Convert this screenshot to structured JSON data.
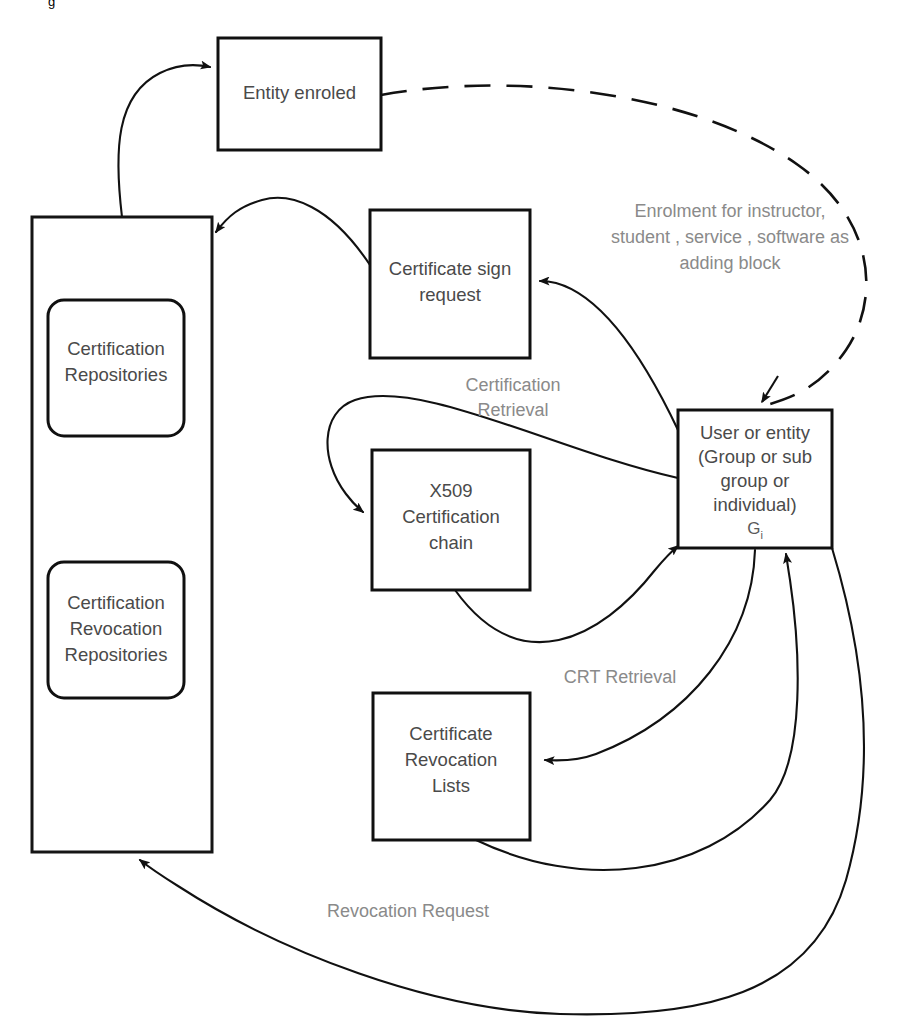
{
  "diagram": {
    "background_color": "#ffffff",
    "stroke_color": "#111111",
    "label_color": "#4a4a4a",
    "edge_label_color": "#8a8a8a",
    "corner_artifact": "g"
  },
  "nodes": {
    "entity_enroled": {
      "label": "Entity enroled",
      "shape": "rectangle"
    },
    "repositories_container": {
      "label": "",
      "shape": "rectangle"
    },
    "certification_repositories": {
      "line1": "Certification",
      "line2": "Repositories",
      "shape": "rounded-rectangle"
    },
    "certification_revocation_repositories": {
      "line1": "Certification",
      "line2": "Revocation",
      "line3": "Repositories",
      "shape": "rounded-rectangle"
    },
    "certificate_sign_request": {
      "line1": "Certificate sign",
      "line2": "request",
      "shape": "rectangle"
    },
    "x509_certification_chain": {
      "line1": "X509",
      "line2": "Certification",
      "line3": "chain",
      "shape": "rectangle"
    },
    "certificate_revocation_lists": {
      "line1": "Certificate",
      "line2": "Revocation",
      "line3": "Lists",
      "shape": "rectangle"
    },
    "user_or_entity": {
      "line1": "User or entity",
      "line2": "(Group or sub",
      "line3": "group or",
      "line4": "individual)",
      "line5_base": "G",
      "line5_sub": "i",
      "shape": "rectangle"
    }
  },
  "edge_labels": {
    "enrolment": {
      "line1": "Enrolment for instructor,",
      "line2": "student , service , software as",
      "line3": "adding block"
    },
    "certification_retrieval": {
      "line1": "Certification",
      "line2": "Retrieval"
    },
    "crt_retrieval": {
      "line1": "CRT Retrieval"
    },
    "revocation_request": {
      "line1": "Revocation Request"
    }
  },
  "edges": [
    {
      "name": "repositories-to-entity-enroled",
      "style": "solid",
      "arrow": "end"
    },
    {
      "name": "entity-enroled-to-user-or-entity",
      "style": "dashed",
      "arrow": "end"
    },
    {
      "name": "certificate-sign-request-to-repositories",
      "style": "solid",
      "arrow": "end"
    },
    {
      "name": "user-or-entity-to-certificate-sign-request",
      "style": "solid",
      "arrow": "end"
    },
    {
      "name": "user-or-entity-to-x509-certification-chain",
      "style": "solid",
      "arrow": "end"
    },
    {
      "name": "x509-certification-chain-to-user-or-entity",
      "style": "solid",
      "arrow": "end"
    },
    {
      "name": "user-or-entity-to-certificate-revocation-lists",
      "style": "solid",
      "arrow": "end"
    },
    {
      "name": "certificate-revocation-lists-to-user-or-entity",
      "style": "solid",
      "arrow": "end"
    },
    {
      "name": "user-or-entity-to-repositories-revocation-request",
      "style": "solid",
      "arrow": "end"
    }
  ]
}
